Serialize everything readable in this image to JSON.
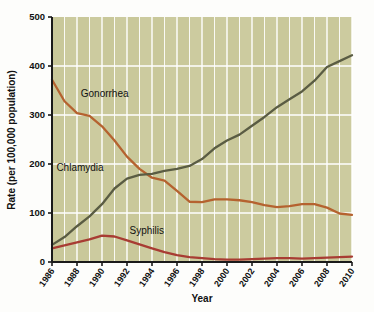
{
  "figure": {
    "background_color": "#fdfdfb",
    "plot_background_color": "#c9c89a",
    "gridline_color": "#ffffff",
    "axis_color": "#1a1a1a"
  },
  "chart_data": {
    "type": "line",
    "title": "",
    "subtitle": "",
    "xlabel": "Year",
    "ylabel": "Rate (per 100,000 population)",
    "xlim": [
      1986,
      2010
    ],
    "ylim": [
      0,
      500
    ],
    "yticks": [
      0,
      100,
      200,
      300,
      400,
      500
    ],
    "ytick_labels": [
      "0",
      "100",
      "200",
      "300",
      "400",
      "500"
    ],
    "xticks": [
      1986,
      1988,
      1990,
      1992,
      1994,
      1996,
      1998,
      2000,
      2002,
      2004,
      2006,
      2008,
      2010
    ],
    "xtick_labels": [
      "1986",
      "1988",
      "1990",
      "1992",
      "1994",
      "1996",
      "1998",
      "2000",
      "2002",
      "2004",
      "2006",
      "2008",
      "2010"
    ],
    "grid": true,
    "grid_axis": "both",
    "legend_position": "inline-annotations",
    "x": [
      1986,
      1987,
      1988,
      1989,
      1990,
      1991,
      1992,
      1993,
      1994,
      1995,
      1996,
      1997,
      1998,
      1999,
      2000,
      2001,
      2002,
      2003,
      2004,
      2005,
      2006,
      2007,
      2008,
      2009,
      2010
    ],
    "series": [
      {
        "name": "Gonorrhea",
        "color": "#b5622f",
        "label_x": 1988.3,
        "label_y": 337,
        "values": [
          372,
          328,
          304,
          298,
          277,
          248,
          215,
          190,
          172,
          166,
          145,
          123,
          122,
          128,
          128,
          126,
          122,
          116,
          112,
          114,
          118,
          118,
          111,
          99,
          96
        ]
      },
      {
        "name": "Chlamydia",
        "color": "#5a5c43",
        "label_x": 1986.35,
        "label_y": 186,
        "values": [
          35,
          51,
          73,
          93,
          118,
          150,
          170,
          178,
          180,
          186,
          190,
          196,
          210,
          232,
          248,
          260,
          278,
          296,
          316,
          332,
          348,
          370,
          398,
          410,
          422
        ]
      },
      {
        "name": "Syphilis",
        "color": "#a83c33",
        "label_x": 1992.2,
        "label_y": 58,
        "values": [
          28,
          34,
          40,
          46,
          54,
          52,
          44,
          36,
          28,
          20,
          14,
          10,
          8,
          6,
          5,
          5,
          6,
          7,
          8,
          8,
          7,
          8,
          9,
          10,
          11
        ]
      }
    ]
  }
}
